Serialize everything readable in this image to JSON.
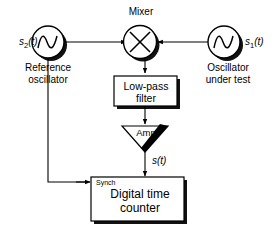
{
  "diagram": {
    "colors": {
      "line": "#000000",
      "shadow": "#1a1a1a",
      "background": "#ffffff",
      "block_fill": "#ffffff"
    },
    "nodes": {
      "reference_oscillator": {
        "signal_label": "s",
        "signal_sub": "2",
        "signal_suffix": "(t)",
        "name_line1": "Reference",
        "name_line2": "oscillator",
        "icon": "sine-wave-icon"
      },
      "oscillator_under_test": {
        "signal_label": "s",
        "signal_sub": "1",
        "signal_suffix": "(t)",
        "name_line1": "Oscillator",
        "name_line2": "under test",
        "icon": "sine-wave-icon"
      },
      "mixer": {
        "label": "Mixer",
        "icon": "multiply-circle-icon"
      },
      "low_pass_filter": {
        "label_line1": "Low-pass",
        "label_line2": "filter"
      },
      "amplifier": {
        "label": "Amp",
        "icon": "triangle-amp-icon"
      },
      "output_signal": {
        "signal_label": "s",
        "signal_suffix": "(t)"
      },
      "digital_time_counter": {
        "synch_label": "Synch",
        "label_line1": "Digital time",
        "label_line2": "counter"
      }
    }
  }
}
